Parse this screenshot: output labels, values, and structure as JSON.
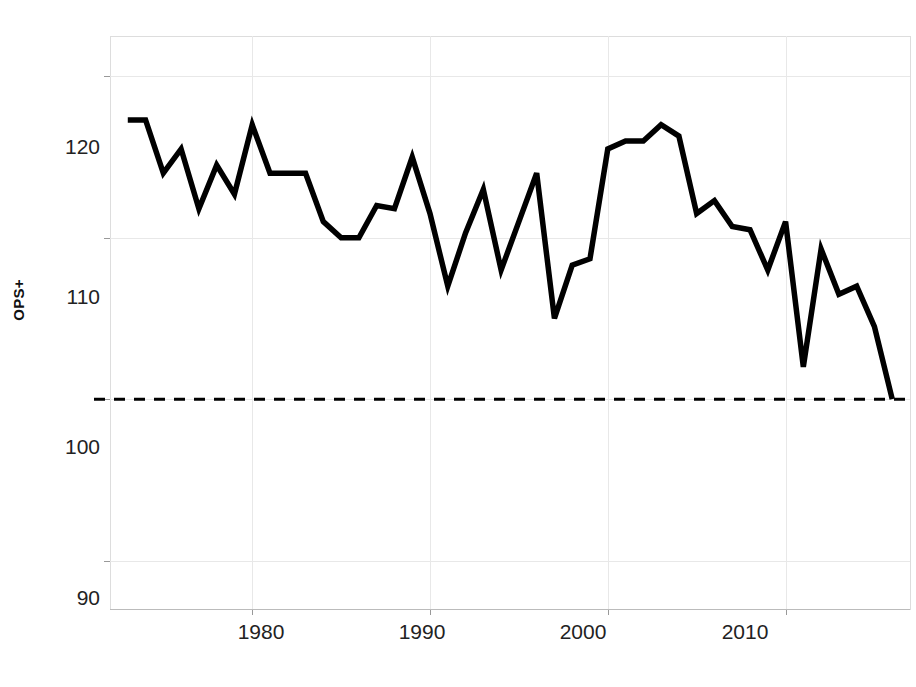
{
  "figure": {
    "title_fragment": "",
    "background_color": "#ffffff",
    "line_color": "#000000",
    "reference_line_color": "#000000",
    "grid_color": "#e8e8e8",
    "axis_color": "#d8d8d8"
  },
  "axes": {
    "y_title": "OPS+",
    "y_ticks": [
      "90",
      "100",
      "110",
      "120"
    ],
    "x_ticks": [
      "1980",
      "1990",
      "2000",
      "2010"
    ]
  },
  "chart_data": {
    "type": "line",
    "title": "",
    "xlabel": "",
    "ylabel": "OPS+",
    "xlim": [
      1972.0,
      2017.0
    ],
    "ylim": [
      87.0,
      122.5
    ],
    "grid": true,
    "legend": "none",
    "y_tick_values": [
      90,
      100,
      110,
      120
    ],
    "x_tick_values": [
      1980,
      1990,
      2000,
      2010
    ],
    "annotations": [
      {
        "type": "horizontal-reference-line",
        "value": 100,
        "style": "dashed",
        "label": ""
      }
    ],
    "series": [
      {
        "name": "OPS+",
        "x": [
          1973,
          1974,
          1975,
          1976,
          1977,
          1978,
          1979,
          1980,
          1981,
          1982,
          1983,
          1984,
          1985,
          1986,
          1987,
          1988,
          1989,
          1990,
          1991,
          1992,
          1993,
          1994,
          1995,
          1996,
          1997,
          1998,
          1999,
          2000,
          2001,
          2002,
          2003,
          2004,
          2005,
          2006,
          2007,
          2008,
          2009,
          2010,
          2011,
          2012,
          2013,
          2014,
          2015,
          2016
        ],
        "values": [
          117.3,
          117.3,
          114.0,
          115.5,
          111.8,
          114.5,
          112.7,
          117.0,
          114.0,
          114.0,
          114.0,
          111.0,
          110.0,
          110.0,
          112.0,
          111.8,
          115.0,
          111.5,
          107.0,
          110.3,
          113.0,
          108.0,
          111.0,
          114.0,
          105.0,
          108.3,
          108.7,
          115.5,
          116.0,
          116.0,
          117.0,
          116.3,
          111.5,
          112.3,
          110.7,
          110.5,
          108.0,
          111.0,
          102.0,
          109.3,
          106.5,
          107.0,
          104.5,
          100.0
        ]
      }
    ]
  }
}
